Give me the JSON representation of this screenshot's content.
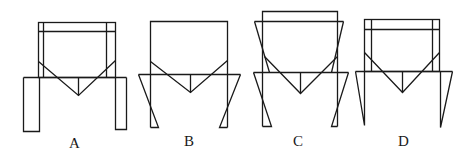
{
  "figures": [
    {
      "id": "A",
      "label": "A",
      "description": "Hopper frame with straight rectangular legs and inner vertical members"
    },
    {
      "id": "B",
      "label": "B",
      "description": "Hopper frame with triangular tapered legs"
    },
    {
      "id": "C",
      "label": "C",
      "description": "Hopper frame with inverted trapezoid top and triangular legs"
    },
    {
      "id": "D",
      "label": "D",
      "description": "Hopper frame with inner vertical members and long pointed legs"
    }
  ],
  "colors": {
    "stroke": "#1a1a1a",
    "background": "#ffffff"
  }
}
